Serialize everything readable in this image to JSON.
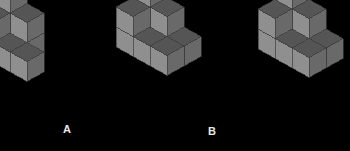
{
  "canvas": {
    "width": 350,
    "height": 151,
    "background": "#000000"
  },
  "palette": {
    "top_face": "#555555",
    "left_face": "#8f8f8f",
    "right_face": "#696969",
    "edge": "#3c3c3c",
    "label_color": "#e8e8e8"
  },
  "projection": {
    "cube_half_width": 17,
    "cube_rise": 9.5,
    "cube_height": 20,
    "note": "isometric: x-axis goes right-down, y-axis goes left-down, z-axis up"
  },
  "figures": [
    {
      "id": "figure-a",
      "label": "A",
      "label_x": 63,
      "label_y": 124,
      "origin_x": 10,
      "origin_y": 34,
      "clipped_edge": "left",
      "cube_count": 9,
      "cubes": [
        [
          0,
          0,
          0
        ],
        [
          1,
          0,
          0
        ],
        [
          0,
          1,
          0
        ],
        [
          1,
          1,
          0
        ],
        [
          2,
          1,
          0
        ],
        [
          0,
          0,
          1
        ],
        [
          1,
          0,
          1
        ],
        [
          0,
          1,
          1
        ],
        [
          0,
          0,
          2
        ]
      ]
    },
    {
      "id": "figure-b",
      "label": "B",
      "label_x": 208,
      "label_y": 126,
      "origin_x": 150,
      "origin_y": 28,
      "clipped_edge": "none",
      "cube_count": 10,
      "cubes": [
        [
          0,
          0,
          0
        ],
        [
          1,
          0,
          0
        ],
        [
          2,
          0,
          0
        ],
        [
          0,
          1,
          0
        ],
        [
          1,
          1,
          0
        ],
        [
          2,
          1,
          0
        ],
        [
          0,
          0,
          1
        ],
        [
          1,
          0,
          1
        ],
        [
          0,
          1,
          1
        ],
        [
          0,
          0,
          2
        ]
      ]
    },
    {
      "id": "figure-c",
      "label": "",
      "label_x": 0,
      "label_y": 0,
      "origin_x": 292,
      "origin_y": 30,
      "clipped_edge": "right",
      "cube_count": 10,
      "cubes": [
        [
          0,
          0,
          0
        ],
        [
          1,
          0,
          0
        ],
        [
          0,
          1,
          0
        ],
        [
          1,
          1,
          0
        ],
        [
          2,
          1,
          0
        ],
        [
          2,
          0,
          0
        ],
        [
          0,
          0,
          1
        ],
        [
          1,
          0,
          1
        ],
        [
          0,
          1,
          1
        ],
        [
          0,
          0,
          2
        ]
      ]
    }
  ]
}
